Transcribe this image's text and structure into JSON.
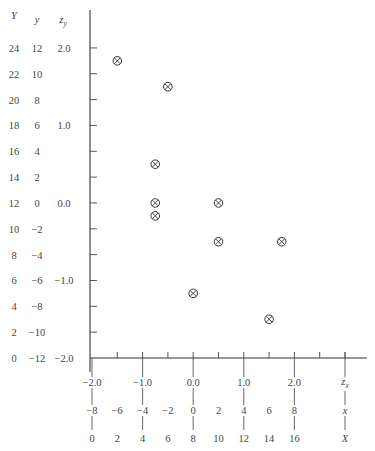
{
  "chart_data": {
    "type": "scatter",
    "title": "",
    "marker": "circled-x",
    "x_axis": {
      "scales": [
        {
          "name": "z_x",
          "label": "z",
          "label_sub": "x",
          "ticks": [
            "-2.0",
            "-1.0",
            "0.0",
            "1.0",
            "2.0"
          ],
          "tick_X_positions": [
            0,
            4,
            8,
            12,
            16
          ]
        },
        {
          "name": "x",
          "label": "x",
          "ticks": [
            "-8",
            "-6",
            "-4",
            "-2",
            "0",
            "2",
            "4",
            "6",
            "8"
          ],
          "tick_X_positions": [
            0,
            2,
            4,
            6,
            8,
            10,
            12,
            14,
            16
          ]
        },
        {
          "name": "X",
          "label": "X",
          "ticks": [
            "0",
            "2",
            "4",
            "6",
            "8",
            "10",
            "12",
            "14",
            "16"
          ],
          "tick_X_positions": [
            0,
            2,
            4,
            6,
            8,
            10,
            12,
            14,
            16
          ]
        }
      ],
      "range": [
        0,
        20
      ]
    },
    "y_axis": {
      "scales": [
        {
          "name": "Y",
          "label": "Y",
          "ticks": [
            "24",
            "22",
            "20",
            "18",
            "16",
            "14",
            "12",
            "10",
            "8",
            "6",
            "4",
            "2",
            "0"
          ]
        },
        {
          "name": "y",
          "label": "y",
          "ticks": [
            "12",
            "10",
            "8",
            "6",
            "4",
            "2",
            "0",
            "-2",
            "-4",
            "-6",
            "-8",
            "-10",
            "-12"
          ]
        },
        {
          "name": "z_y",
          "label": "z",
          "label_sub": "y",
          "ticks": [
            "2.0",
            "",
            "",
            "1.0",
            "",
            "",
            "0.0",
            "",
            "",
            "-1.0",
            "",
            "",
            "-2.0"
          ]
        }
      ],
      "tick_Y_positions": [
        24,
        22,
        20,
        18,
        16,
        14,
        12,
        10,
        8,
        6,
        4,
        2,
        0
      ],
      "range": [
        0,
        24
      ]
    },
    "points": [
      {
        "X": 2,
        "Y": 23
      },
      {
        "X": 6,
        "Y": 21
      },
      {
        "X": 5,
        "Y": 15
      },
      {
        "X": 5,
        "Y": 12
      },
      {
        "X": 10,
        "Y": 12
      },
      {
        "X": 5,
        "Y": 11
      },
      {
        "X": 10,
        "Y": 9
      },
      {
        "X": 15,
        "Y": 9
      },
      {
        "X": 8,
        "Y": 5
      },
      {
        "X": 14,
        "Y": 3
      }
    ],
    "grid": false,
    "legend": null
  }
}
